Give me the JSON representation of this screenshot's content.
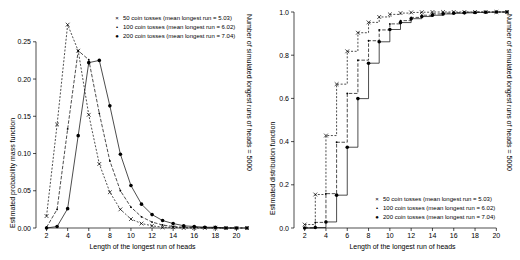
{
  "figure": {
    "panels": [
      {
        "id": "pmf",
        "xlabel": "Length of the longest run of heads",
        "ylabel_left": "Estimated probability mass function",
        "ylabel_right": "Number of simulated longest runs of heads = 5000",
        "legend": [
          {
            "symbol": "×",
            "label": "50 coin tosses (mean longest run = 5.03)"
          },
          {
            "symbol": "•",
            "label": "100 coin tosses (mean longest run = 6.02)"
          },
          {
            "symbol": "●",
            "label": "200 coin tosses (mean longest run = 7.04)"
          }
        ]
      },
      {
        "id": "cdf",
        "xlabel": "Length of the longest run of heads",
        "ylabel_left": "Estimated distribution function",
        "ylabel_right": "Number of simulated longest runs of heads = 5000",
        "legend": [
          {
            "symbol": "×",
            "label": "50 coin tosses (mean longest run = 5.03)"
          },
          {
            "symbol": "•",
            "label": "100 coin tosses (mean longest run = 6.02)"
          },
          {
            "symbol": "●",
            "label": "200 coin tosses (mean longest run = 7.04)"
          }
        ]
      }
    ]
  },
  "chart_data": [
    {
      "type": "line",
      "id": "pmf",
      "title": "",
      "xlabel": "Length of the longest run of heads",
      "ylabel": "Estimated probability mass function",
      "ylabel_secondary": "Number of simulated longest runs of heads = 5000",
      "xlim": [
        1,
        21
      ],
      "ylim": [
        0.0,
        0.29
      ],
      "xticks": [
        2,
        4,
        6,
        8,
        10,
        12,
        14,
        16,
        18,
        20
      ],
      "yticks": [
        0.0,
        0.05,
        0.1,
        0.15,
        0.2,
        0.25
      ],
      "ytick_labels": [
        "0.00",
        "0.05",
        "0.10",
        "0.15",
        "0.20",
        "0.25"
      ],
      "grid": false,
      "legend_position": "top-right",
      "series": [
        {
          "name": "50 coin tosses (mean longest run = 5.03)",
          "marker": "cross",
          "x": [
            2,
            3,
            4,
            5,
            6,
            7,
            8,
            9,
            10,
            11,
            12,
            13,
            14,
            15,
            16,
            17,
            18,
            19,
            20,
            21
          ],
          "values": [
            0.016,
            0.139,
            0.273,
            0.238,
            0.152,
            0.086,
            0.048,
            0.025,
            0.012,
            0.006,
            0.003,
            0.001,
            0.001,
            0.0,
            0.0,
            0.0,
            0.0,
            0.0,
            0.0,
            0.0
          ]
        },
        {
          "name": "100 coin tosses (mean longest run = 6.02)",
          "marker": "smalldot",
          "x": [
            2,
            3,
            4,
            5,
            6,
            7,
            8,
            9,
            10,
            11,
            12,
            13,
            14,
            15,
            16,
            17,
            18,
            19,
            20,
            21
          ],
          "values": [
            0.001,
            0.025,
            0.133,
            0.238,
            0.226,
            0.154,
            0.09,
            0.05,
            0.028,
            0.015,
            0.008,
            0.004,
            0.002,
            0.001,
            0.001,
            0.0,
            0.0,
            0.0,
            0.0,
            0.0
          ]
        },
        {
          "name": "200 coin tosses (mean longest run = 7.04)",
          "marker": "dot",
          "x": [
            2,
            3,
            4,
            5,
            6,
            7,
            8,
            9,
            10,
            11,
            12,
            13,
            14,
            15,
            16,
            17,
            18,
            19,
            20,
            21
          ],
          "values": [
            0.0,
            0.002,
            0.026,
            0.124,
            0.222,
            0.225,
            0.164,
            0.099,
            0.057,
            0.032,
            0.018,
            0.01,
            0.006,
            0.003,
            0.002,
            0.001,
            0.001,
            0.0,
            0.0,
            0.0
          ]
        }
      ]
    },
    {
      "type": "line",
      "id": "cdf",
      "title": "",
      "xlabel": "Length of the longest run of heads",
      "ylabel": "Estimated distribution function",
      "ylabel_secondary": "Number of simulated longest runs of heads = 5000",
      "xlim": [
        1,
        21
      ],
      "ylim": [
        0.0,
        1.0
      ],
      "xticks": [
        2,
        4,
        6,
        8,
        10,
        12,
        14,
        16,
        18,
        20
      ],
      "yticks": [
        0.0,
        0.2,
        0.4,
        0.6,
        0.8,
        1.0
      ],
      "ytick_labels": [
        "0.0",
        "0.2",
        "0.4",
        "0.6",
        "0.8",
        "1.0"
      ],
      "grid": false,
      "legend_position": "bottom-right",
      "series": [
        {
          "name": "50 coin tosses (mean longest run = 5.03)",
          "marker": "cross",
          "x": [
            2,
            3,
            4,
            5,
            6,
            7,
            8,
            9,
            10,
            11,
            12,
            13,
            14,
            15,
            16,
            17,
            18,
            19,
            20,
            21
          ],
          "values": [
            0.016,
            0.155,
            0.428,
            0.666,
            0.818,
            0.904,
            0.952,
            0.977,
            0.989,
            0.995,
            0.998,
            0.999,
            1.0,
            1.0,
            1.0,
            1.0,
            1.0,
            1.0,
            1.0,
            1.0
          ]
        },
        {
          "name": "100 coin tosses (mean longest run = 6.02)",
          "marker": "smalldot",
          "x": [
            2,
            3,
            4,
            5,
            6,
            7,
            8,
            9,
            10,
            11,
            12,
            13,
            14,
            15,
            16,
            17,
            18,
            19,
            20,
            21
          ],
          "values": [
            0.001,
            0.026,
            0.159,
            0.397,
            0.623,
            0.777,
            0.867,
            0.917,
            0.945,
            0.96,
            0.975,
            0.985,
            0.991,
            0.995,
            0.997,
            0.999,
            1.0,
            1.0,
            1.0,
            1.0
          ]
        },
        {
          "name": "200 coin tosses (mean longest run = 7.04)",
          "marker": "dot",
          "x": [
            2,
            3,
            4,
            5,
            6,
            7,
            8,
            9,
            10,
            11,
            12,
            13,
            14,
            15,
            16,
            17,
            18,
            19,
            20,
            21
          ],
          "values": [
            0.0,
            0.002,
            0.028,
            0.152,
            0.374,
            0.599,
            0.763,
            0.862,
            0.919,
            0.951,
            0.969,
            0.979,
            0.985,
            0.991,
            0.994,
            0.996,
            0.998,
            0.999,
            1.0,
            1.0
          ]
        }
      ]
    }
  ]
}
